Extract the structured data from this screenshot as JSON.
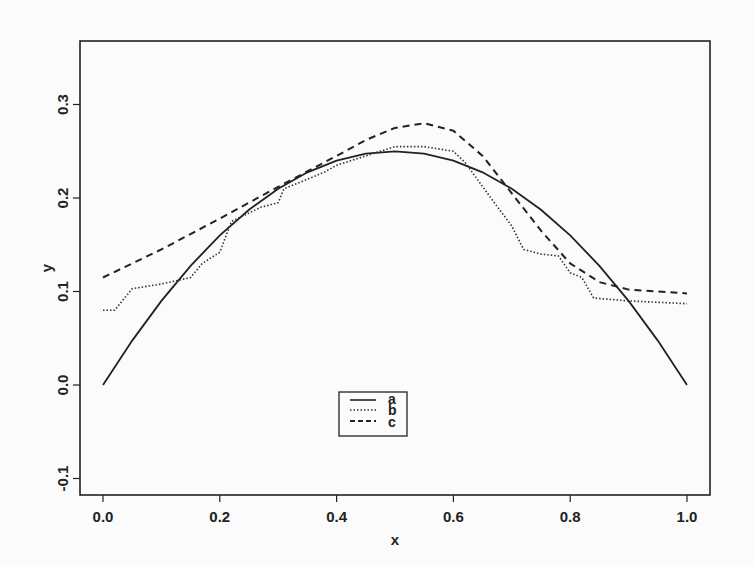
{
  "chart_data": {
    "type": "line",
    "title": "",
    "xlabel": "x",
    "ylabel": "y",
    "xlim": [
      0.0,
      1.0
    ],
    "ylim": [
      -0.1,
      0.3
    ],
    "xticks": [
      "0.0",
      "0.2",
      "0.4",
      "0.6",
      "0.8",
      "1.0"
    ],
    "yticks": [
      "-0.1",
      "0.0",
      "0.1",
      "0.2",
      "0.3"
    ],
    "grid": false,
    "legend": {
      "position": "bottom-center",
      "entries": [
        "a",
        "b",
        "c"
      ]
    },
    "series": [
      {
        "name": "a",
        "style": "solid",
        "x": [
          0.0,
          0.05,
          0.1,
          0.15,
          0.2,
          0.25,
          0.3,
          0.35,
          0.4,
          0.45,
          0.5,
          0.55,
          0.6,
          0.65,
          0.7,
          0.75,
          0.8,
          0.85,
          0.9,
          0.95,
          1.0
        ],
        "values": [
          0.0,
          0.0475,
          0.09,
          0.1275,
          0.16,
          0.1875,
          0.21,
          0.2275,
          0.24,
          0.2475,
          0.25,
          0.2475,
          0.24,
          0.2275,
          0.21,
          0.1875,
          0.16,
          0.1275,
          0.09,
          0.0475,
          0.0
        ]
      },
      {
        "name": "b",
        "style": "dotted",
        "x": [
          0.0,
          0.02,
          0.05,
          0.1,
          0.15,
          0.17,
          0.2,
          0.22,
          0.27,
          0.3,
          0.31,
          0.35,
          0.38,
          0.4,
          0.45,
          0.5,
          0.55,
          0.6,
          0.62,
          0.67,
          0.7,
          0.72,
          0.75,
          0.78,
          0.8,
          0.82,
          0.84,
          0.9,
          1.0
        ],
        "values": [
          0.08,
          0.08,
          0.103,
          0.108,
          0.115,
          0.13,
          0.142,
          0.175,
          0.19,
          0.195,
          0.21,
          0.22,
          0.228,
          0.235,
          0.245,
          0.255,
          0.255,
          0.25,
          0.238,
          0.195,
          0.17,
          0.145,
          0.14,
          0.138,
          0.12,
          0.115,
          0.093,
          0.09,
          0.087
        ]
      },
      {
        "name": "c",
        "style": "dashed",
        "x": [
          0.0,
          0.1,
          0.2,
          0.3,
          0.4,
          0.45,
          0.5,
          0.55,
          0.6,
          0.65,
          0.7,
          0.75,
          0.8,
          0.85,
          0.9,
          1.0
        ],
        "values": [
          0.115,
          0.145,
          0.178,
          0.212,
          0.245,
          0.262,
          0.275,
          0.28,
          0.272,
          0.245,
          0.205,
          0.165,
          0.13,
          0.11,
          0.102,
          0.098
        ]
      }
    ]
  }
}
